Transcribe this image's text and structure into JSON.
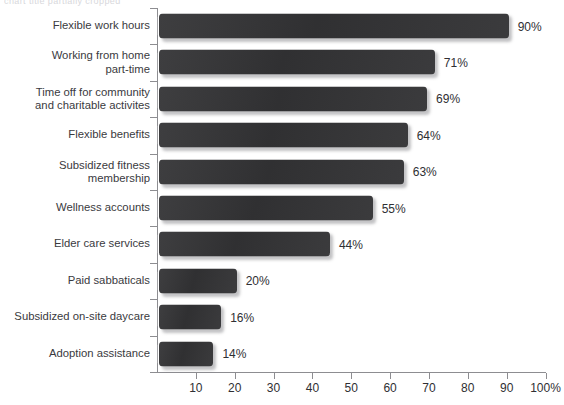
{
  "header": {
    "clipped_text": "chart title partially cropped"
  },
  "chart_data": {
    "type": "bar",
    "orientation": "horizontal",
    "title": "",
    "subtitle": "",
    "xlabel": "",
    "ylabel": "",
    "xlim": [
      0,
      100
    ],
    "grid": false,
    "legend": null,
    "bar_color": "#333335",
    "axis_color": "#8d8d91",
    "text_color": "#2f2f33",
    "background": "#ffffff",
    "x_tick_values": [
      10,
      20,
      30,
      40,
      50,
      60,
      70,
      80,
      90,
      100
    ],
    "x_tick_labels": [
      "10",
      "20",
      "30",
      "40",
      "50",
      "60",
      "70",
      "80",
      "90",
      "100%"
    ],
    "categories": [
      "Flexible work hours",
      "Working from home\npart-time",
      "Time off for community\nand charitable activites",
      "Flexible benefits",
      "Subsidized fitness\nmembership",
      "Wellness accounts",
      "Elder care services",
      "Paid sabbaticals",
      "Subsidized on-site daycare",
      "Adoption assistance"
    ],
    "values": [
      90,
      71,
      69,
      64,
      63,
      55,
      44,
      20,
      16,
      14
    ],
    "value_labels": [
      "90%",
      "71%",
      "69%",
      "64%",
      "63%",
      "55%",
      "44%",
      "20%",
      "16%",
      "14%"
    ]
  }
}
